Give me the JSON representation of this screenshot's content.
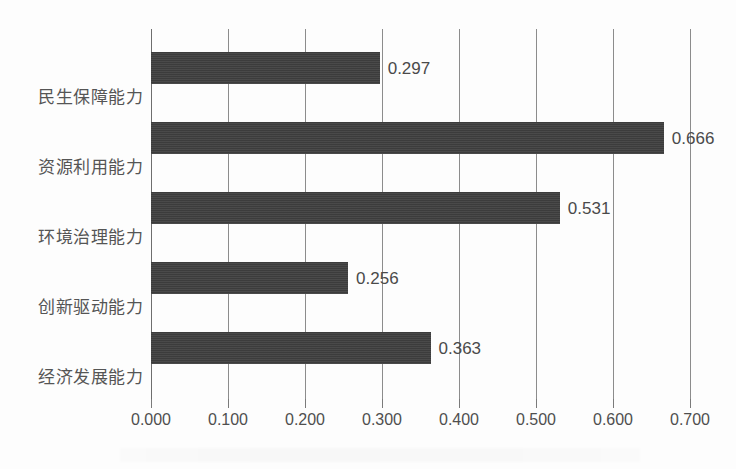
{
  "chart_data": {
    "type": "bar",
    "orientation": "horizontal",
    "title": "",
    "subtitle": "",
    "xlabel": "",
    "ylabel": "",
    "categories": [
      "民生保障能力",
      "资源利用能力",
      "环境治理能力",
      "创新驱动能力",
      "经济发展能力"
    ],
    "values": [
      0.297,
      0.666,
      0.531,
      0.256,
      0.363
    ],
    "data_labels": [
      "0.297",
      "0.666",
      "0.531",
      "0.256",
      "0.363"
    ],
    "xlim": [
      0.0,
      0.7
    ],
    "xticks": [
      0.0,
      0.1,
      0.2,
      0.3,
      0.4,
      0.5,
      0.6,
      0.7
    ],
    "xtick_labels": [
      "0.000",
      "0.100",
      "0.200",
      "0.300",
      "0.400",
      "0.500",
      "0.600",
      "0.700"
    ],
    "grid": "vertical",
    "legend": "none",
    "bar_color": "#3f3f3f",
    "gridline_color": "#8c8c8c",
    "label_color": "#555555",
    "background_color": "#fdfdfd"
  }
}
